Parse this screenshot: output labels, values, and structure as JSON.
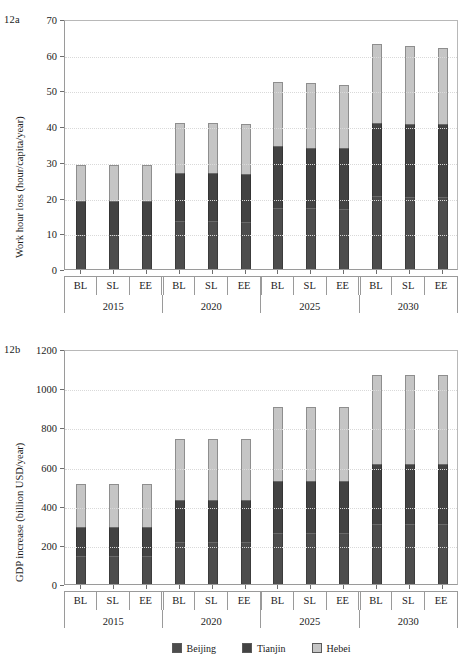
{
  "figure": {
    "panels": [
      {
        "tag": "12a",
        "ylabel": "Work hour loss (hour/capita/year)",
        "ytick_labels": [
          "70",
          "60",
          "50",
          "40",
          "30",
          "20",
          "10",
          "0"
        ]
      },
      {
        "tag": "12b",
        "ylabel": "GDP increase (billion USD/year)",
        "ytick_labels": [
          "1200",
          "1000",
          "800",
          "600",
          "400",
          "200",
          "0"
        ]
      }
    ],
    "legend": {
      "items": [
        {
          "label": "Beijing",
          "color": "#4d4d4d"
        },
        {
          "label": "Tianjin",
          "color": "#434343"
        },
        {
          "label": "Hebei",
          "color": "#c5c5c5"
        }
      ]
    }
  },
  "chart_data": [
    {
      "type": "bar",
      "id": "12a",
      "title": "12a",
      "stacked": true,
      "xlabel": "",
      "ylabel": "Work hour loss (hour/capita/year)",
      "ylim": [
        0,
        70
      ],
      "ytick_values": [
        0,
        10,
        20,
        30,
        40,
        50,
        60,
        70
      ],
      "grid": true,
      "legend_position": "bottom",
      "groups": [
        "2015",
        "2020",
        "2025",
        "2030"
      ],
      "categories": [
        "BL",
        "SL",
        "EE",
        "BL",
        "SL",
        "EE",
        "BL",
        "SL",
        "EE",
        "BL",
        "SL",
        "EE"
      ],
      "x": [
        "2015 BL",
        "2015 SL",
        "2015 EE",
        "2020 BL",
        "2020 SL",
        "2020 EE",
        "2025 BL",
        "2025 SL",
        "2025 EE",
        "2030 BL",
        "2030 SL",
        "2030 EE"
      ],
      "series": [
        {
          "name": "Beijing",
          "color": "#4d4d4d",
          "values": [
            9.6,
            9.6,
            9.6,
            13.5,
            13.5,
            13.3,
            17.2,
            17.0,
            16.9,
            20.5,
            20.3,
            20.3
          ]
        },
        {
          "name": "Tianjin",
          "color": "#434343",
          "values": [
            9.4,
            9.4,
            9.4,
            13.5,
            13.5,
            13.2,
            17.3,
            17.0,
            16.9,
            20.5,
            20.2,
            20.2
          ]
        },
        {
          "name": "Hebei",
          "color": "#c5c5c5",
          "values": [
            10.0,
            10.0,
            10.0,
            14.0,
            14.0,
            14.0,
            18.0,
            18.0,
            17.7,
            22.0,
            22.0,
            21.5
          ]
        }
      ],
      "totals": [
        29.0,
        29.0,
        29.0,
        41.0,
        41.0,
        40.5,
        52.5,
        52.0,
        51.5,
        63.0,
        62.5,
        62.0
      ]
    },
    {
      "type": "bar",
      "id": "12b",
      "title": "12b",
      "stacked": true,
      "xlabel": "",
      "ylabel": "GDP increase (billion USD/year)",
      "ylim": [
        0,
        1200
      ],
      "ytick_values": [
        0,
        200,
        400,
        600,
        800,
        1000,
        1200
      ],
      "grid": true,
      "legend_position": "bottom",
      "groups": [
        "2015",
        "2020",
        "2025",
        "2030"
      ],
      "categories": [
        "BL",
        "SL",
        "EE",
        "BL",
        "SL",
        "EE",
        "BL",
        "SL",
        "EE",
        "BL",
        "SL",
        "EE"
      ],
      "x": [
        "2015 BL",
        "2015 SL",
        "2015 EE",
        "2020 BL",
        "2020 SL",
        "2020 EE",
        "2025 BL",
        "2025 SL",
        "2025 EE",
        "2030 BL",
        "2030 SL",
        "2030 EE"
      ],
      "series": [
        {
          "name": "Beijing",
          "color": "#4d4d4d",
          "values": [
            145,
            145,
            145,
            215,
            215,
            215,
            263,
            263,
            263,
            308,
            308,
            308
          ]
        },
        {
          "name": "Tianjin",
          "color": "#434343",
          "values": [
            145,
            145,
            145,
            215,
            215,
            215,
            262,
            262,
            262,
            307,
            307,
            307
          ]
        },
        {
          "name": "Hebei",
          "color": "#c5c5c5",
          "values": [
            222,
            222,
            220,
            310,
            310,
            310,
            380,
            380,
            380,
            450,
            450,
            450
          ]
        }
      ],
      "totals": [
        512,
        512,
        510,
        740,
        740,
        740,
        905,
        905,
        905,
        1065,
        1065,
        1065
      ]
    }
  ]
}
